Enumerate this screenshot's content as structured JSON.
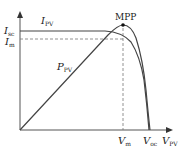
{
  "labels": {
    "isc": "I",
    "isc_sub": "sc",
    "im": "I",
    "im_sub": "m",
    "ipv": "I",
    "ipv_sub": "PV",
    "ppv": "P",
    "ppv_sub": "PV",
    "mpp": "MPP",
    "vm": "V",
    "vm_sub": "m",
    "voc": "V",
    "voc_sub": "oc",
    "vpv": "V",
    "vpv_sub": "PV"
  },
  "colors": {
    "curve": "#444444",
    "axis": "#555555",
    "dash": "#777777"
  }
}
